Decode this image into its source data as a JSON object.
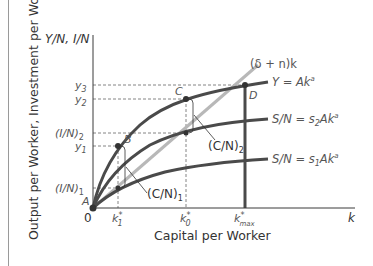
{
  "diagram": {
    "y_axis_title": "Output per Worker, Investment per Worker",
    "x_axis_title": "Capital per Worker",
    "y_axis_label": "Y/N, I/N",
    "x_axis_label": "k",
    "origin_label": "0",
    "y_ticks": {
      "y3": "y",
      "y3_sub": "3",
      "y2": "y",
      "y2_sub": "2",
      "in2": "(I/N)",
      "in2_sub": "2",
      "y1": "y",
      "y1_sub": "1",
      "in1": "(I/N)",
      "in1_sub": "1"
    },
    "x_ticks": {
      "k1": "k",
      "k1_sup": "*",
      "k1_sub": "1",
      "k0": "k",
      "k0_sup": "*",
      "k0_sub": "0",
      "kmax": "k",
      "kmax_sup": "*",
      "kmax_sub": "max"
    },
    "points": {
      "A": "A",
      "B": "B",
      "C": "C",
      "D": "D"
    },
    "curves": {
      "depreciation_line": "(δ + n)k",
      "output": "Y = Ak",
      "output_exp": "a",
      "saving_2": "S/N = s",
      "saving_2_sub": "2",
      "saving_2_tail": "Ak",
      "saving_2_exp": "a",
      "saving_1": "S/N = s",
      "saving_1_sub": "1",
      "saving_1_tail": "Ak",
      "saving_1_exp": "a"
    },
    "annotations": {
      "cn1": "(C/N)",
      "cn1_sub": "1",
      "cn2": "(C/N)",
      "cn2_sub": "2"
    },
    "colors": {
      "curve": "#4a4a4a",
      "line_gray": "#b8b8b8",
      "axis": "#3a3a3a",
      "label": "#555555"
    }
  }
}
